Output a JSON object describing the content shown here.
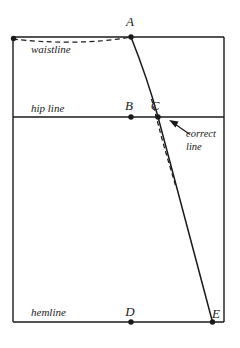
{
  "figure": {
    "type": "pattern-drafting-diagram",
    "title_text": "",
    "stroke_color": "#1a1a1a",
    "background_color": "#ffffff",
    "labels": {
      "point_a": "A",
      "point_b": "B",
      "point_c": "C",
      "point_d": "D",
      "point_e": "E",
      "waistline": "waistline",
      "hip_line": "hip line",
      "hemline": "hemline",
      "note_line_1": "correct",
      "note_line_2": "line"
    },
    "geometry": {
      "frame": {
        "left": 13,
        "top": 37,
        "right": 224,
        "bottom": 322
      },
      "points": {
        "A": {
          "x": 131,
          "y": 37
        },
        "B": {
          "x": 131,
          "y": 117
        },
        "C": {
          "x": 158,
          "y": 117
        },
        "D": {
          "x": 131,
          "y": 322
        },
        "E": {
          "x": 212,
          "y": 322
        },
        "waist_left": {
          "x": 13,
          "y": 39
        }
      },
      "hip_line_y": 117,
      "curve_a_to_c": "M 131 37 C 141 62, 151 92, 158 117",
      "line_c_to_e": "M 158 117 L 212 322",
      "dashed_waist": "M 13 39 C 45 43, 95 44, 131 37",
      "dashed_correct": "M 152 100 C 155 112, 158 124, 163 140 C 168 158, 172 172, 176 186",
      "arrow": {
        "from_x": 190,
        "from_y": 134,
        "to_x": 170,
        "to_y": 121
      }
    }
  }
}
